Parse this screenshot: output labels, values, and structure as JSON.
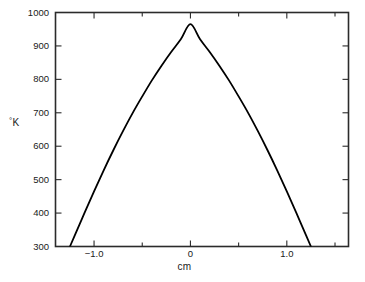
{
  "chart_data": {
    "type": "line",
    "title": "",
    "subtitle": "",
    "xlabel": "cm",
    "ylabel": "°K",
    "ylabel_degree": "°",
    "ylabel_unit": "K",
    "xlim": [
      -1.4,
      1.64
    ],
    "ylim": [
      300,
      1000
    ],
    "grid": false,
    "legend": null,
    "legend_position": "none",
    "frame": "box",
    "tick_direction": "out",
    "line_color": "#000000",
    "axis_color": "#2b2b2b",
    "background": "#ffffff",
    "x_major_ticks": [
      -1.0,
      0,
      1.0
    ],
    "x_major_tick_labels": [
      "−1.0",
      "0",
      "1.0"
    ],
    "x_minor_ticks": [
      -1.5,
      -0.5,
      0.5,
      1.5
    ],
    "y_major_ticks": [
      300,
      400,
      500,
      600,
      700,
      800,
      900,
      1000
    ],
    "y_major_tick_labels": [
      "300",
      "400",
      "500",
      "600",
      "700",
      "800",
      "900",
      "1000"
    ],
    "peak": {
      "x": 0,
      "y": 965
    },
    "x": [
      -1.25,
      -1.2,
      -1.1,
      -1.0,
      -0.9,
      -0.8,
      -0.7,
      -0.6,
      -0.5,
      -0.4,
      -0.3,
      -0.2,
      -0.1,
      0,
      0.1,
      0.2,
      0.3,
      0.4,
      0.5,
      0.6,
      0.7,
      0.8,
      0.9,
      1.0,
      1.1,
      1.2,
      1.25
    ],
    "y": [
      300,
      333,
      400,
      465,
      528,
      588,
      645,
      699,
      749,
      797,
      841,
      882,
      920,
      965,
      920,
      882,
      841,
      797,
      749,
      699,
      645,
      588,
      528,
      465,
      400,
      333,
      300
    ],
    "series": [
      {
        "name": "temperature profile",
        "values": [
          300,
          333,
          400,
          465,
          528,
          588,
          645,
          699,
          749,
          797,
          841,
          882,
          920,
          965,
          920,
          882,
          841,
          797,
          749,
          699,
          645,
          588,
          528,
          465,
          400,
          333,
          300
        ]
      }
    ]
  },
  "figure": {
    "x_axis_title": "cm",
    "y_axis_title_degree": "°",
    "y_axis_title_unit": "K"
  }
}
